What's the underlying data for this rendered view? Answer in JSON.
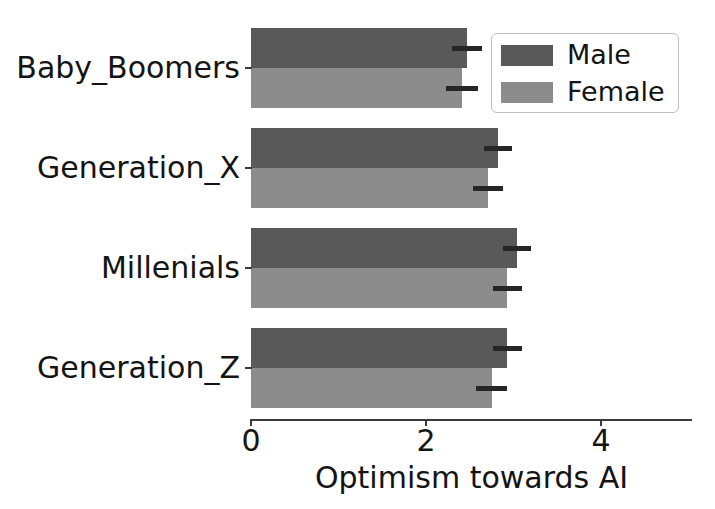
{
  "chart_data": {
    "type": "bar",
    "orientation": "horizontal",
    "title": "",
    "subtitle": "",
    "xlabel": "Optimism towards AI",
    "ylabel": "",
    "categories": [
      "Baby_Boomers",
      "Generation_X",
      "Millenials",
      "Generation_Z"
    ],
    "series": [
      {
        "name": "Male",
        "color": "#595959",
        "values": [
          2.47,
          2.82,
          3.04,
          2.93
        ],
        "errors": [
          0.17,
          0.16,
          0.16,
          0.17
        ]
      },
      {
        "name": "Female",
        "color": "#8c8c8c",
        "values": [
          2.41,
          2.71,
          2.93,
          2.75
        ],
        "errors": [
          0.18,
          0.17,
          0.17,
          0.18
        ]
      }
    ],
    "xlim": [
      0,
      5.04
    ],
    "xticks": [
      0,
      2,
      4
    ],
    "xtick_labels": [
      "0",
      "2",
      "4"
    ],
    "grid": false,
    "legend_position": "upper right",
    "error_bars": true
  },
  "axes": {
    "x_tick_labels": [
      "0",
      "2",
      "4"
    ],
    "x_label": "Optimism towards AI",
    "y_tick_labels": [
      "Baby_Boomers",
      "Generation_X",
      "Millenials",
      "Generation_Z"
    ]
  },
  "legend": {
    "entries": [
      {
        "label": "Male",
        "color": "#595959"
      },
      {
        "label": "Female",
        "color": "#8c8c8c"
      }
    ]
  },
  "colors": {
    "male": "#595959",
    "female": "#8c8c8c",
    "axis": "#3a3a3a",
    "text": "#141414",
    "background": "#ffffff",
    "error_bar": "#262626",
    "legend_border": "#bfbfbf"
  }
}
